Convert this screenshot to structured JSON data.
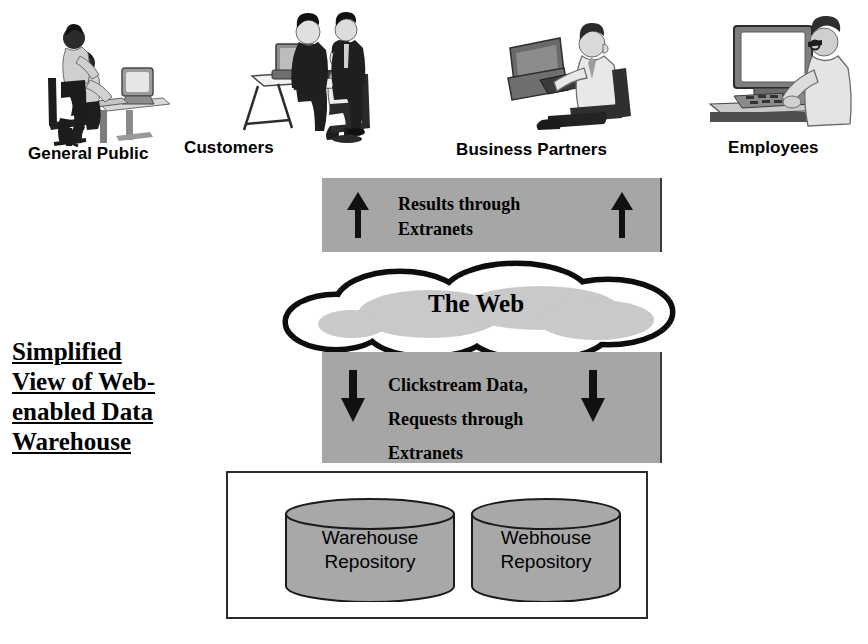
{
  "diagram": {
    "title_lines": [
      "Simplified",
      "View of Web-",
      "enabled Data",
      "Warehouse"
    ],
    "colors": {
      "bar_gray": "#a6a6a6",
      "cylinder_gray": "#a8a8a8",
      "outline_black": "#1a1a1a",
      "cloud_inner_gray": "#c9c9c9",
      "background": "#ffffff"
    },
    "actors": [
      {
        "label": "General Public",
        "icon": "two-people-at-desktop-computer-icon"
      },
      {
        "label": "Customers",
        "icon": "three-people-at-computer-desk-icon"
      },
      {
        "label": "Business Partners",
        "icon": "man-typing-at-computer-icon"
      },
      {
        "label": "Employees",
        "icon": "man-at-monitor-and-keyboard-icon"
      }
    ],
    "upflow": {
      "lines": [
        "Results through",
        "Extranets"
      ],
      "arrow_direction": "up",
      "arrow_count": 2
    },
    "cloud": {
      "label": "The Web",
      "icon": "cloud-icon"
    },
    "downflow": {
      "lines": [
        "Clickstream Data,",
        "Requests through",
        "Extranets"
      ],
      "arrow_direction": "down",
      "arrow_count": 2
    },
    "repositories": [
      {
        "lines": [
          "Warehouse",
          "Repository"
        ],
        "icon": "database-cylinder-icon"
      },
      {
        "lines": [
          "Webhouse",
          "Repository"
        ],
        "icon": "database-cylinder-icon"
      }
    ]
  }
}
